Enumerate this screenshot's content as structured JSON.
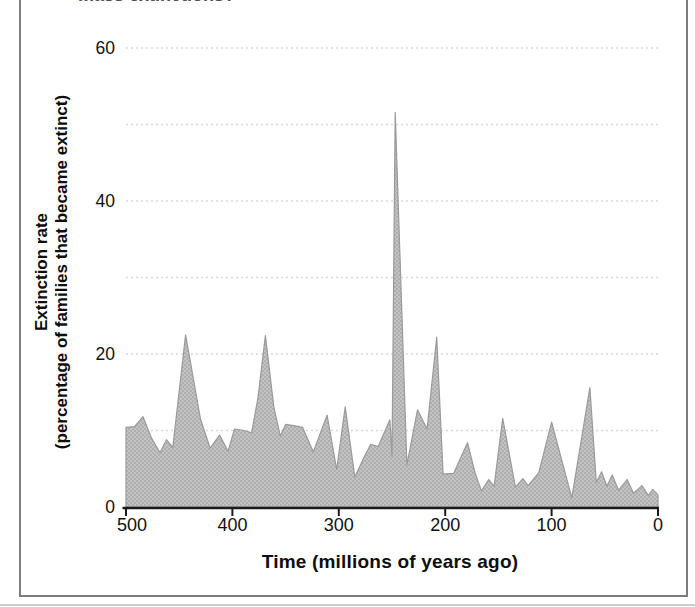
{
  "figure": {
    "top_cutoff_text": "mass extinctions?",
    "y_axis": {
      "label_line1": "Extinction rate",
      "label_line2": "(percentage of families that became extinct)",
      "ticks": [
        0,
        20,
        40,
        60
      ]
    },
    "x_axis": {
      "title": "Time  (millions of years ago)",
      "ticks": [
        500,
        400,
        300,
        200,
        100,
        0
      ]
    }
  },
  "chart_data": {
    "type": "area",
    "title": "",
    "xlabel": "Time  (millions of years ago)",
    "ylabel": "Extinction rate (percentage of families that became extinct)",
    "x_reversed": true,
    "xlim": [
      500,
      0
    ],
    "ylim": [
      0,
      62
    ],
    "grid": "horizontal dotted gridlines every 10 units from 10 to 60",
    "x_ticks": [
      500,
      400,
      300,
      200,
      100,
      0
    ],
    "y_ticks": [
      0,
      20,
      40,
      60
    ],
    "y_gridlines": [
      10,
      20,
      30,
      40,
      50,
      60
    ],
    "series_name": "extinction rate (% of families that became extinct)",
    "points": [
      [
        500,
        10.4
      ],
      [
        492,
        10.5
      ],
      [
        484,
        11.8
      ],
      [
        476,
        9.0
      ],
      [
        468,
        7.1
      ],
      [
        462,
        8.8
      ],
      [
        456,
        7.8
      ],
      [
        444,
        22.5
      ],
      [
        430,
        11.5
      ],
      [
        421,
        7.7
      ],
      [
        412,
        9.4
      ],
      [
        404,
        7.3
      ],
      [
        398,
        10.2
      ],
      [
        389,
        10.0
      ],
      [
        382,
        9.7
      ],
      [
        376,
        14.2
      ],
      [
        369,
        22.4
      ],
      [
        361,
        13.0
      ],
      [
        355,
        9.3
      ],
      [
        350,
        10.8
      ],
      [
        341,
        10.6
      ],
      [
        334,
        10.4
      ],
      [
        324,
        7.2
      ],
      [
        311,
        12.0
      ],
      [
        302,
        4.9
      ],
      [
        294,
        13.1
      ],
      [
        285,
        3.9
      ],
      [
        277,
        6.3
      ],
      [
        270,
        8.2
      ],
      [
        263,
        7.9
      ],
      [
        252,
        11.4
      ],
      [
        250,
        6.6
      ],
      [
        247,
        51.6
      ],
      [
        236,
        5.5
      ],
      [
        226,
        12.7
      ],
      [
        217,
        10.2
      ],
      [
        208,
        22.2
      ],
      [
        202,
        4.3
      ],
      [
        192,
        4.4
      ],
      [
        179,
        8.4
      ],
      [
        172,
        4.5
      ],
      [
        166,
        2.1
      ],
      [
        159,
        3.6
      ],
      [
        154,
        2.7
      ],
      [
        146,
        11.6
      ],
      [
        134,
        2.6
      ],
      [
        127,
        3.7
      ],
      [
        122,
        2.8
      ],
      [
        112,
        4.5
      ],
      [
        100,
        11.1
      ],
      [
        81,
        1.2
      ],
      [
        64,
        15.6
      ],
      [
        58,
        3.2
      ],
      [
        53,
        4.6
      ],
      [
        48,
        2.7
      ],
      [
        43,
        4.2
      ],
      [
        37,
        2.2
      ],
      [
        29,
        3.6
      ],
      [
        23,
        1.8
      ],
      [
        15,
        2.8
      ],
      [
        9,
        1.5
      ],
      [
        5,
        2.3
      ],
      [
        0,
        1.6
      ]
    ],
    "colors": {
      "area_fill": "#c3c3c3",
      "area_dot": "#a5a5a5",
      "area_edge": "#9a9a9a",
      "axis": "#1c1c1c",
      "gridline": "#d9d9d9",
      "tick_text": "#111111",
      "border": "#7d7d7d"
    }
  }
}
